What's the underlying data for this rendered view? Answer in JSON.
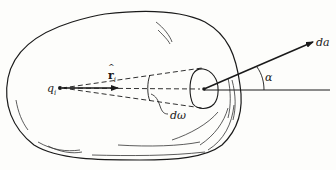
{
  "figure": {
    "type": "physics-diagram",
    "colors": {
      "stroke": "#1a1a1a",
      "background": "#fdfdfb"
    }
  },
  "labels": {
    "charge": "q",
    "charge_sub": "i",
    "unit_vector": "r",
    "unit_vector_sub": "i",
    "solid_angle": "dω",
    "area_element": "da",
    "angle": "α"
  },
  "elements": {
    "charge_point": {
      "x": 60,
      "y": 88
    },
    "surface_patch_center": {
      "x": 204,
      "y": 89
    },
    "area_vector_tip": {
      "x": 314,
      "y": 42
    },
    "reference_line_end": {
      "x": 330,
      "y": 90
    }
  }
}
